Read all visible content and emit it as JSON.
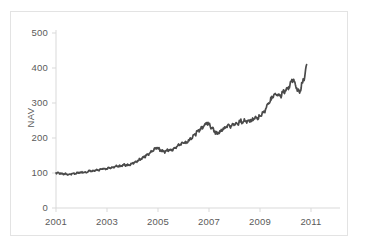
{
  "chart_data": {
    "type": "line",
    "title": "",
    "xlabel": "",
    "ylabel": "NAV",
    "xlim": [
      2001,
      2011
    ],
    "ylim": [
      0,
      500
    ],
    "grid": false,
    "legend": null,
    "legend_position": "none",
    "line_color": "#4a4a4a",
    "axis_color": "#d9d9d9",
    "tick_label_color": "#5a5a5a",
    "frame_color": "#e3e3e3",
    "x_ticks": [
      "2001",
      "2003",
      "2005",
      "2007",
      "2009",
      "2011"
    ],
    "x_tick_values": [
      2001,
      2003,
      2005,
      2007,
      2009,
      2011
    ],
    "y_ticks": [
      "0",
      "100",
      "200",
      "300",
      "400",
      "500"
    ],
    "y_tick_values": [
      0,
      100,
      200,
      300,
      400,
      500
    ],
    "series": [
      {
        "name": "NAV",
        "x": [
          2001.0,
          2001.08,
          2001.17,
          2001.25,
          2001.33,
          2001.42,
          2001.5,
          2001.58,
          2001.67,
          2001.75,
          2001.83,
          2001.92,
          2002.0,
          2002.08,
          2002.17,
          2002.25,
          2002.33,
          2002.42,
          2002.5,
          2002.58,
          2002.67,
          2002.75,
          2002.83,
          2002.92,
          2003.0,
          2003.08,
          2003.17,
          2003.25,
          2003.33,
          2003.42,
          2003.5,
          2003.58,
          2003.67,
          2003.75,
          2003.83,
          2003.92,
          2004.0,
          2004.08,
          2004.17,
          2004.25,
          2004.33,
          2004.42,
          2004.5,
          2004.58,
          2004.67,
          2004.75,
          2004.83,
          2004.92,
          2005.0,
          2005.08,
          2005.17,
          2005.25,
          2005.33,
          2005.42,
          2005.5,
          2005.58,
          2005.67,
          2005.75,
          2005.83,
          2005.92,
          2006.0,
          2006.08,
          2006.17,
          2006.25,
          2006.33,
          2006.42,
          2006.5,
          2006.58,
          2006.67,
          2006.75,
          2006.83,
          2006.92,
          2007.0,
          2007.08,
          2007.17,
          2007.25,
          2007.33,
          2007.42,
          2007.5,
          2007.58,
          2007.67,
          2007.75,
          2007.83,
          2007.92,
          2008.0,
          2008.08,
          2008.17,
          2008.25,
          2008.33,
          2008.42,
          2008.5,
          2008.58,
          2008.67,
          2008.75,
          2008.83,
          2008.92,
          2009.0,
          2009.08,
          2009.17,
          2009.25,
          2009.33,
          2009.42,
          2009.5,
          2009.58,
          2009.67,
          2009.75,
          2009.83,
          2009.92,
          2010.0,
          2010.08,
          2010.17,
          2010.25,
          2010.33,
          2010.42,
          2010.5,
          2010.58,
          2010.67,
          2010.75
        ],
        "values": [
          100,
          101,
          99,
          97,
          98,
          96,
          95,
          97,
          99,
          98,
          100,
          102,
          101,
          103,
          102,
          104,
          106,
          105,
          107,
          109,
          108,
          110,
          112,
          111,
          113,
          115,
          114,
          116,
          118,
          120,
          119,
          121,
          124,
          123,
          122,
          125,
          128,
          131,
          133,
          136,
          140,
          144,
          148,
          152,
          156,
          161,
          166,
          172,
          170,
          166,
          163,
          161,
          164,
          167,
          165,
          168,
          172,
          176,
          180,
          184,
          188,
          185,
          190,
          196,
          202,
          208,
          214,
          220,
          226,
          232,
          238,
          244,
          240,
          232,
          224,
          217,
          212,
          216,
          222,
          228,
          232,
          236,
          234,
          238,
          242,
          239,
          244,
          248,
          245,
          250,
          247,
          252,
          249,
          254,
          258,
          256,
          262,
          268,
          276,
          286,
          298,
          308,
          318,
          326,
          322,
          318,
          325,
          330,
          334,
          338,
          342,
          348,
          352,
          358,
          364,
          352,
          344,
          338
        ]
      }
    ],
    "extra_series_detail": {
      "x2": [
        2010.0,
        2010.04,
        2010.08,
        2010.12,
        2010.17,
        2010.21,
        2010.25,
        2010.29,
        2010.33,
        2010.38,
        2010.42,
        2010.46,
        2010.5,
        2010.54,
        2010.58,
        2010.62,
        2010.67,
        2010.71,
        2010.75,
        2010.79,
        2010.83
      ],
      "values2": [
        334,
        337,
        340,
        345,
        350,
        356,
        362,
        366,
        360,
        352,
        346,
        340,
        334,
        330,
        338,
        348,
        358,
        368,
        380,
        392,
        404
      ]
    },
    "note": "Monthly net asset value index, base 100 at January 2001, rising to approximately 405 by late 2010."
  },
  "axis": {
    "y_title": "NAV"
  }
}
